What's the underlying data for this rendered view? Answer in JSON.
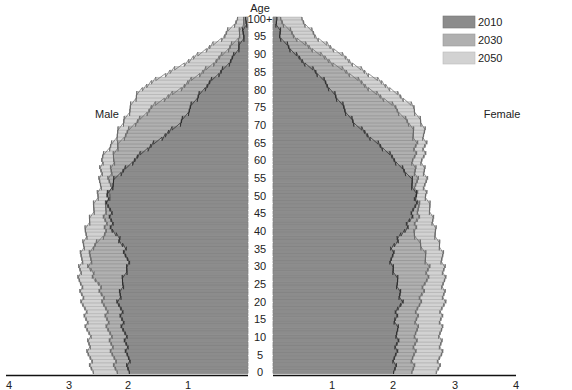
{
  "chart_data": {
    "type": "bar",
    "subtype": "population-pyramid",
    "title": "",
    "ylabel": "Age",
    "xlabel": "",
    "xlim": [
      4,
      4
    ],
    "x_ticks_left": [
      "4",
      "3",
      "2",
      "1"
    ],
    "x_ticks_right": [
      "1",
      "2",
      "3",
      "4"
    ],
    "center_zero_label": "0",
    "y_ticks": [
      "0",
      "5",
      "10",
      "15",
      "20",
      "25",
      "30",
      "35",
      "40",
      "45",
      "50",
      "55",
      "60",
      "65",
      "70",
      "75",
      "80",
      "85",
      "90",
      "95",
      "100+"
    ],
    "side_labels": {
      "left": "Male",
      "right": "Female"
    },
    "legend": [
      {
        "name": "2010",
        "color": "#8c8c8c"
      },
      {
        "name": "2030",
        "color": "#b0b0b0"
      },
      {
        "name": "2050",
        "color": "#d2d2d2"
      }
    ],
    "anchor_ages": [
      0,
      5,
      10,
      15,
      20,
      25,
      30,
      35,
      40,
      45,
      50,
      55,
      60,
      65,
      70,
      75,
      80,
      85,
      90,
      95,
      100
    ],
    "series": [
      {
        "name": "2010",
        "sex": "Male",
        "values": [
          2.0,
          2.0,
          2.05,
          2.1,
          2.15,
          2.1,
          2.0,
          2.05,
          2.25,
          2.3,
          2.35,
          2.2,
          1.9,
          1.55,
          1.15,
          0.95,
          0.75,
          0.45,
          0.2,
          0.08,
          0.02
        ]
      },
      {
        "name": "2030",
        "sex": "Male",
        "values": [
          2.2,
          2.25,
          2.3,
          2.35,
          2.4,
          2.5,
          2.65,
          2.6,
          2.35,
          2.4,
          2.3,
          2.3,
          2.25,
          2.15,
          1.9,
          1.6,
          1.15,
          0.75,
          0.4,
          0.15,
          0.05
        ]
      },
      {
        "name": "2050",
        "sex": "Male",
        "values": [
          2.6,
          2.65,
          2.65,
          2.7,
          2.75,
          2.8,
          2.8,
          2.75,
          2.7,
          2.6,
          2.5,
          2.45,
          2.45,
          2.25,
          2.1,
          1.95,
          1.8,
          1.3,
          0.8,
          0.4,
          0.15
        ]
      },
      {
        "name": "2010",
        "sex": "Female",
        "values": [
          2.0,
          2.0,
          2.05,
          2.0,
          2.1,
          2.05,
          1.95,
          1.95,
          2.15,
          2.3,
          2.35,
          2.25,
          2.0,
          1.7,
          1.35,
          1.15,
          0.95,
          0.7,
          0.35,
          0.12,
          0.04
        ]
      },
      {
        "name": "2030",
        "sex": "Female",
        "values": [
          2.3,
          2.3,
          2.35,
          2.35,
          2.4,
          2.5,
          2.55,
          2.45,
          2.3,
          2.4,
          2.35,
          2.35,
          2.3,
          2.35,
          2.25,
          2.0,
          1.6,
          1.2,
          0.75,
          0.35,
          0.1
        ]
      },
      {
        "name": "2050",
        "sex": "Female",
        "values": [
          2.7,
          2.75,
          2.75,
          2.75,
          2.8,
          2.8,
          2.8,
          2.75,
          2.65,
          2.6,
          2.5,
          2.5,
          2.45,
          2.5,
          2.45,
          2.3,
          1.95,
          1.5,
          1.1,
          0.7,
          0.45
        ]
      }
    ]
  }
}
